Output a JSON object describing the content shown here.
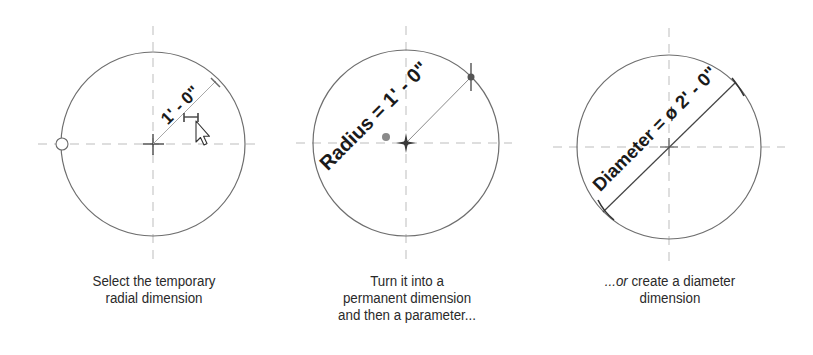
{
  "panels": [
    {
      "id": "temporary",
      "dimension_label": "1' - 0\"",
      "caption_lines": [
        "Select the temporary",
        "radial dimension"
      ]
    },
    {
      "id": "permanent",
      "dimension_label": "Radius = 1' - 0\"",
      "caption_lines": [
        "Turn it into a",
        "permanent dimension",
        "and then a parameter..."
      ]
    },
    {
      "id": "diameter",
      "dimension_label": "Diameter = ø 2' - 0\"",
      "caption_prefix_italic": "...or",
      "caption_lines": [
        " create a diameter",
        "dimension"
      ]
    }
  ],
  "colors": {
    "circle": "#6e6e6e",
    "centerline": "#b5b5b5",
    "dimension_line": "#8a8a8a",
    "text": "#1a1a1a"
  },
  "icons": {
    "cursor": "arrow-pointer",
    "grip": "circle-grip",
    "center_mark": "crosshair"
  }
}
